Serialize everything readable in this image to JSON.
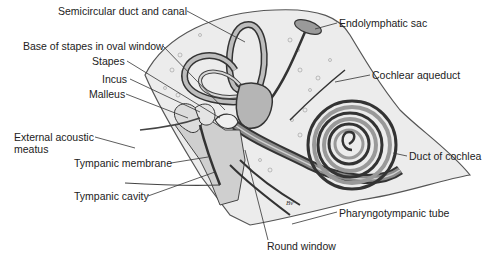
{
  "diagram": {
    "labels": [
      {
        "id": "semicircular",
        "text": "Semicircular duct and canal",
        "x": 58,
        "y": 5
      },
      {
        "id": "endolymphatic",
        "text": "Endolymphatic sac",
        "x": 339,
        "y": 17
      },
      {
        "id": "base-stapes",
        "text": "Base of stapes in oval window",
        "x": 23,
        "y": 40
      },
      {
        "id": "stapes",
        "text": "Stapes",
        "x": 92,
        "y": 55
      },
      {
        "id": "incus",
        "text": "Incus",
        "x": 102,
        "y": 73
      },
      {
        "id": "malleus",
        "text": "Malleus",
        "x": 89,
        "y": 88
      },
      {
        "id": "cochlear-aqueduct",
        "text": "Cochlear aqueduct",
        "x": 372,
        "y": 69
      },
      {
        "id": "external-acoustic",
        "text": "External acoustic",
        "x": 14,
        "y": 131
      },
      {
        "id": "meatus",
        "text": "meatus",
        "x": 14,
        "y": 143
      },
      {
        "id": "tympanic-membrane",
        "text": "Tympanic membrane",
        "x": 74,
        "y": 157
      },
      {
        "id": "duct-cochlea",
        "text": "Duct of cochlea",
        "x": 409,
        "y": 150
      },
      {
        "id": "tympanic-cavity",
        "text": "Tympanic cavity",
        "x": 74,
        "y": 190
      },
      {
        "id": "pharyngotympanic",
        "text": "Pharyngotympanic tube",
        "x": 339,
        "y": 207
      },
      {
        "id": "round-window",
        "text": "Round window",
        "x": 267,
        "y": 240
      }
    ],
    "signature": "Bv"
  }
}
